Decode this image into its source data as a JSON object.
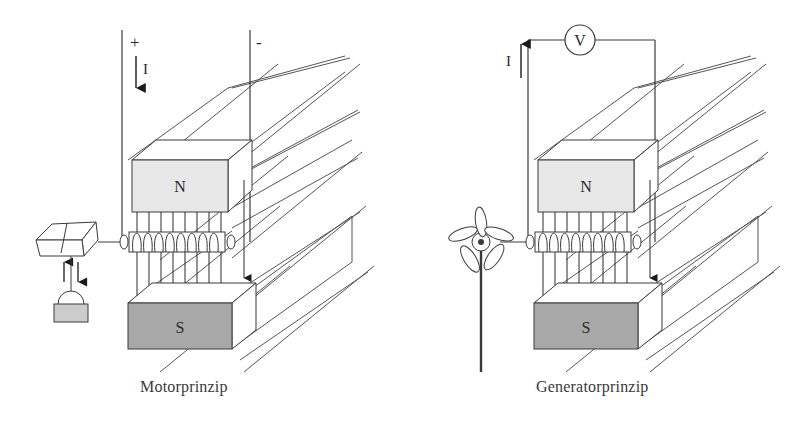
{
  "figure": {
    "type": "physics-diagram",
    "background_color": "#ffffff",
    "line_color": "#3a3a3a"
  },
  "palette": {
    "north_pole_fill": "#e8e8e8",
    "south_pole_fill": "#a8a8a8",
    "weight_fill": "#cccccc",
    "stroke": "#3a3a3a",
    "arrow_fill": "#1a1a1a"
  },
  "panels": [
    {
      "id": "motor",
      "caption": "Motorprinzip",
      "source": {
        "kind": "dc-supply",
        "terminal_positive": "+",
        "terminal_negative": "-",
        "current_symbol": "I",
        "current_direction": "down"
      },
      "magnet_north": {
        "label": "N",
        "fill": "#e8e8e8"
      },
      "magnet_south": {
        "label": "S",
        "fill": "#a8a8a8"
      },
      "coil": {
        "turns": 8,
        "orientation": "horizontal"
      },
      "field_arrows": {
        "count": 8,
        "direction": "down"
      },
      "load": {
        "kind": "winch-drum-with-weight",
        "arrow_up": "↑",
        "arrow_down": "↓"
      },
      "perspective_lines": 4
    },
    {
      "id": "generator",
      "caption": "Generatorprinzip",
      "source": {
        "kind": "voltmeter",
        "meter_label": "V",
        "current_symbol": "I",
        "current_direction": "up"
      },
      "magnet_north": {
        "label": "N",
        "fill": "#e8e8e8"
      },
      "magnet_south": {
        "label": "S",
        "fill": "#a8a8a8"
      },
      "coil": {
        "turns": 8,
        "orientation": "horizontal"
      },
      "field_arrows": {
        "count": 8,
        "direction": "down"
      },
      "drive": {
        "kind": "wind-turbine",
        "blades": 5
      },
      "perspective_lines": 4
    }
  ],
  "labels": {
    "plus": "+",
    "minus": "-",
    "current": "I",
    "voltmeter": "V",
    "north": "N",
    "south": "S",
    "arrow_up": "↑",
    "arrow_down": "↓",
    "motor_caption": "Motorprinzip",
    "generator_caption": "Generatorprinzip"
  }
}
